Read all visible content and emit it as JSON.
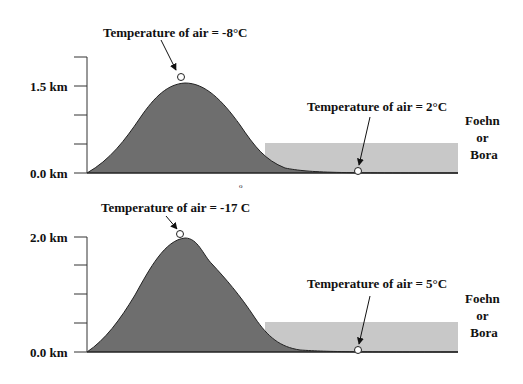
{
  "panels": [
    {
      "id": "top",
      "axis": {
        "top_label": "1.5 km",
        "bottom_label": "0.0 km"
      },
      "summit_label": "Temperature of air = -8°C",
      "lee_label": "Temperature of air = 2°C",
      "wind_label": [
        "Foehn",
        "or",
        "Bora"
      ]
    },
    {
      "id": "bottom",
      "axis": {
        "top_label": "2.0 km",
        "bottom_label": "0.0 km"
      },
      "summit_label": "Temperature of air = -17 C",
      "lee_label": "Temperature of air = 5°C",
      "wind_label": [
        "Foehn",
        "or",
        "Bora"
      ]
    }
  ],
  "stray_mark": "o",
  "colors": {
    "mountain": "#6e6e6e",
    "wind_band": "#c8c8c8",
    "line": "#222222"
  }
}
